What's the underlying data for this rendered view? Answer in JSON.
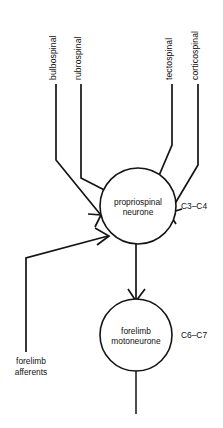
{
  "figure": {
    "background_color": "#ffffff",
    "stroke_color": "#141414",
    "text_color": "#121212"
  },
  "descending_tracts": [
    {
      "id": "bulbospinal",
      "label": "bulbospinal"
    },
    {
      "id": "rubrospinal",
      "label": "rubrospinal"
    },
    {
      "id": "tectospinal",
      "label": "tectospinal"
    },
    {
      "id": "corticospinal",
      "label": "corticospinal"
    }
  ],
  "neurons": {
    "propriospinal": {
      "label_line1": "propriospinal",
      "label_line2": "neurone",
      "segment": "C3–C4"
    },
    "motoneurone": {
      "label_line1": "forelimb",
      "label_line2": "motoneurone",
      "segment": "C6–C7"
    }
  },
  "afferents": {
    "label_line1": "forelimb",
    "label_line2": "afferents"
  }
}
